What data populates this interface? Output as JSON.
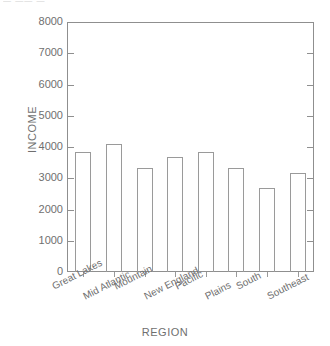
{
  "artifact": {
    "top_text": "— ——  —"
  },
  "chart_data": {
    "type": "bar",
    "title": "",
    "xlabel": "REGION",
    "ylabel": "INCOME",
    "categories": [
      "Great Lakes",
      "Mid Atlantic",
      "Mountain",
      "New England",
      "Pacific",
      "Plains",
      "South",
      "Southeast"
    ],
    "values": [
      3850,
      4100,
      3320,
      3680,
      3850,
      3330,
      2680,
      3170
    ],
    "ylim": [
      0,
      8000
    ],
    "ytick_labels": [
      "8000",
      "7000",
      "6000",
      "5000",
      "4000",
      "3000",
      "2000",
      "1000",
      "0"
    ],
    "ytick_values": [
      8000,
      7000,
      6000,
      5000,
      4000,
      3000,
      2000,
      1000,
      0
    ],
    "grid": false,
    "legend": false,
    "bar_style": "outline-only",
    "colors": {
      "bar_outline": "#9a9a9a",
      "axis": "#8f8f8f",
      "text": "#6f6f6f",
      "background": "#ffffff"
    }
  }
}
